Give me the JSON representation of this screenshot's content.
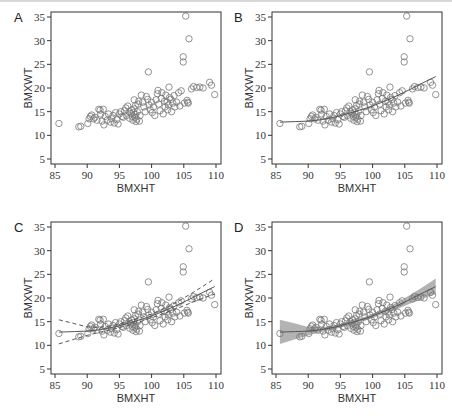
{
  "figure": {
    "panels": [
      {
        "letter": "A",
        "xlabel": "BMXHT",
        "ylabel": "BMXWT",
        "fit": "none"
      },
      {
        "letter": "B",
        "xlabel": "BMXHT",
        "ylabel": "BMXWT",
        "fit": "smooth"
      },
      {
        "letter": "C",
        "xlabel": "BMXHT",
        "ylabel": "BMXWT",
        "fit": "smooth_dashed_ci"
      },
      {
        "letter": "D",
        "xlabel": "BMXHT",
        "ylabel": "BMXWT",
        "fit": "smooth_shaded_ci"
      }
    ]
  },
  "chart_data": {
    "type": "scatter",
    "title": "",
    "xlabel": "BMXHT",
    "ylabel": "BMXWT",
    "xlim": [
      85,
      110
    ],
    "ylim": [
      5,
      35
    ],
    "xticks": [
      85,
      90,
      95,
      100,
      105,
      110
    ],
    "yticks": [
      5,
      10,
      15,
      20,
      25,
      30,
      35
    ],
    "grid": false,
    "panels": [
      "A",
      "B",
      "C",
      "D"
    ],
    "points": [
      [
        85.6,
        12.5
      ],
      [
        88.7,
        11.8
      ],
      [
        89.0,
        11.9
      ],
      [
        90.1,
        12.5
      ],
      [
        90.3,
        13.5
      ],
      [
        90.5,
        14.0
      ],
      [
        90.7,
        14.3
      ],
      [
        91.0,
        13.5
      ],
      [
        91.2,
        13.8
      ],
      [
        91.5,
        13.2
      ],
      [
        91.8,
        15.5
      ],
      [
        92.0,
        15.3
      ],
      [
        92.1,
        14.5
      ],
      [
        92.3,
        13.0
      ],
      [
        92.5,
        15.5
      ],
      [
        92.6,
        12.2
      ],
      [
        92.8,
        14.0
      ],
      [
        93.1,
        13.2
      ],
      [
        93.3,
        14.5
      ],
      [
        93.6,
        12.8
      ],
      [
        93.8,
        13.5
      ],
      [
        94.0,
        14.2
      ],
      [
        94.2,
        12.6
      ],
      [
        94.4,
        14.8
      ],
      [
        94.6,
        13.3
      ],
      [
        94.8,
        12.4
      ],
      [
        95.0,
        14.5
      ],
      [
        95.2,
        15.0
      ],
      [
        95.4,
        14.0
      ],
      [
        95.6,
        13.8
      ],
      [
        95.8,
        15.2
      ],
      [
        96.0,
        15.8
      ],
      [
        96.1,
        14.2
      ],
      [
        96.3,
        16.2
      ],
      [
        96.5,
        15.0
      ],
      [
        96.6,
        13.6
      ],
      [
        96.8,
        14.6
      ],
      [
        96.9,
        15.4
      ],
      [
        97.0,
        14.0
      ],
      [
        97.1,
        13.2
      ],
      [
        97.2,
        14.8
      ],
      [
        97.3,
        15.6
      ],
      [
        97.4,
        13.8
      ],
      [
        97.5,
        14.4
      ],
      [
        97.6,
        12.9
      ],
      [
        97.7,
        13.4
      ],
      [
        97.8,
        15.0
      ],
      [
        97.9,
        16.6
      ],
      [
        98.0,
        17.2
      ],
      [
        98.1,
        13.0
      ],
      [
        98.2,
        14.2
      ],
      [
        97.3,
        17.5
      ],
      [
        97.5,
        16.3
      ],
      [
        98.4,
        18.5
      ],
      [
        98.6,
        17.0
      ],
      [
        98.8,
        16.0
      ],
      [
        99.0,
        15.0
      ],
      [
        99.2,
        18.2
      ],
      [
        99.4,
        17.6
      ],
      [
        99.5,
        23.4
      ],
      [
        99.6,
        16.4
      ],
      [
        99.8,
        15.4
      ],
      [
        100.0,
        17.0
      ],
      [
        100.1,
        14.8
      ],
      [
        100.3,
        16.0
      ],
      [
        100.5,
        14.2
      ],
      [
        100.7,
        17.5
      ],
      [
        100.9,
        18.8
      ],
      [
        101.0,
        19.5
      ],
      [
        101.1,
        16.6
      ],
      [
        101.3,
        15.2
      ],
      [
        101.5,
        17.8
      ],
      [
        101.6,
        19.0
      ],
      [
        101.8,
        14.5
      ],
      [
        102.0,
        17.2
      ],
      [
        102.1,
        16.0
      ],
      [
        102.2,
        18.5
      ],
      [
        102.4,
        17.0
      ],
      [
        102.5,
        15.4
      ],
      [
        102.6,
        16.4
      ],
      [
        102.7,
        20.2
      ],
      [
        102.8,
        18.0
      ],
      [
        103.0,
        17.6
      ],
      [
        103.1,
        15.0
      ],
      [
        103.3,
        16.8
      ],
      [
        103.5,
        18.4
      ],
      [
        103.6,
        16.0
      ],
      [
        103.9,
        17.0
      ],
      [
        104.2,
        19.0
      ],
      [
        104.4,
        16.2
      ],
      [
        104.6,
        19.4
      ],
      [
        104.9,
        26.6
      ],
      [
        104.9,
        25.5
      ],
      [
        105.1,
        16.8
      ],
      [
        105.3,
        35.2
      ],
      [
        105.5,
        17.4
      ],
      [
        105.6,
        17.0
      ],
      [
        105.7,
        16.8
      ],
      [
        105.8,
        30.4
      ],
      [
        106.2,
        19.8
      ],
      [
        106.5,
        20.3
      ],
      [
        107.0,
        20.1
      ],
      [
        107.5,
        20.2
      ],
      [
        108.0,
        20.0
      ],
      [
        109.0,
        21.2
      ],
      [
        109.3,
        20.6
      ],
      [
        109.8,
        18.6
      ]
    ],
    "fit_line": {
      "x": [
        85.6,
        88,
        90,
        92,
        94,
        96,
        98,
        100,
        102,
        104,
        106,
        108,
        109.8
      ],
      "y": [
        12.8,
        12.9,
        13.0,
        13.3,
        13.8,
        14.5,
        15.3,
        16.2,
        17.3,
        18.5,
        19.8,
        21.2,
        22.4
      ]
    },
    "ci_lower": {
      "x": [
        85.6,
        88,
        90,
        92,
        94,
        96,
        98,
        100,
        102,
        104,
        106,
        108,
        109.8
      ],
      "y": [
        10.3,
        11.3,
        12.1,
        12.8,
        13.4,
        14.1,
        14.9,
        15.8,
        16.8,
        17.8,
        18.9,
        20.0,
        20.8
      ]
    },
    "ci_upper": {
      "x": [
        85.6,
        88,
        90,
        92,
        94,
        96,
        98,
        100,
        102,
        104,
        106,
        108,
        109.8
      ],
      "y": [
        15.4,
        14.6,
        13.9,
        13.8,
        14.2,
        14.9,
        15.7,
        16.6,
        17.8,
        19.2,
        20.8,
        22.5,
        24.1
      ]
    },
    "marker": "open-circle",
    "colors": {
      "points": "#777777",
      "line": "#555555",
      "band": "#9a9a9a",
      "axis": "#333333"
    }
  }
}
